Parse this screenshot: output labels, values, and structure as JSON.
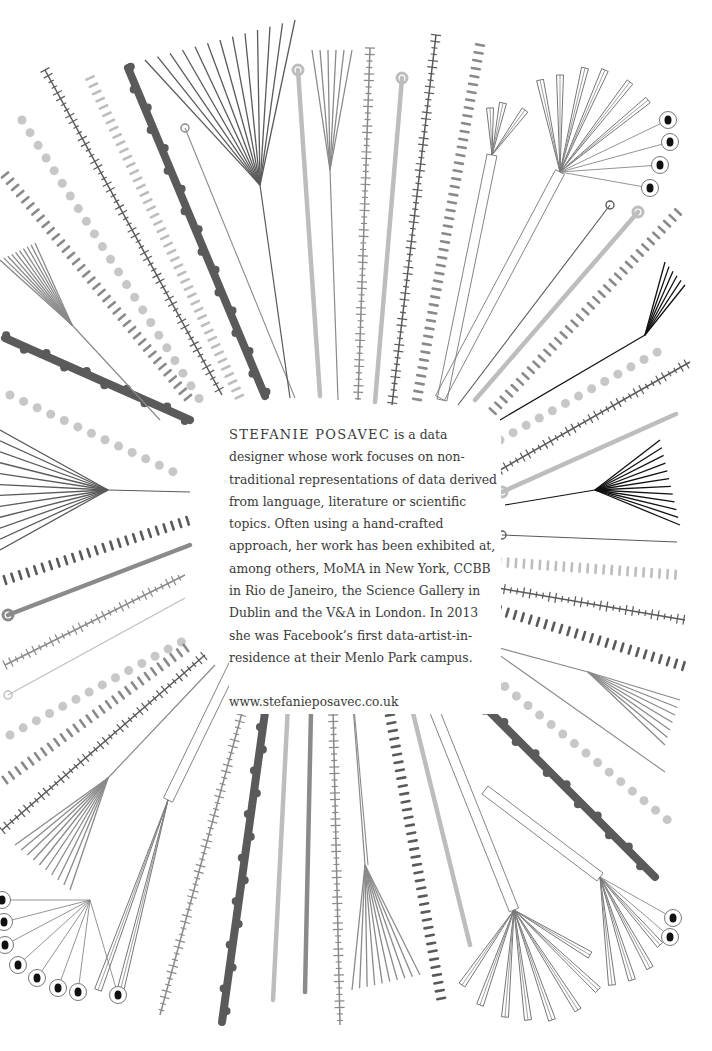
{
  "bio": {
    "name": "STEFANIE POSAVEC",
    "text": " is a data designer whose work focuses on non-traditional representations of data derived from language, literature or scientific topics. Often using a hand-crafted approach, her work has been exhibited at, among others, MoMA in New York, CCBB in Rio de Janeiro, the Science Gallery in Dublin and the V&A in London. In 2013 she was Facebook’s first data-artist-in-residence at their Menlo Park campus.",
    "url": "www.stefanieposavec.co.uk"
  },
  "artwork": {
    "description": "Hand-drawn radial illustration of lines, dotted strokes, hatched strokes, fans and looped stems surrounding the biography text",
    "colors": {
      "dark": "#5a5a5a",
      "mid": "#8a8a8a",
      "light": "#bdbdbd",
      "ink": "#111111"
    },
    "strokes": [
      {
        "x1": 45,
        "y1": 70,
        "x2": 222,
        "y2": 395,
        "style": "hatch",
        "c": "dark"
      },
      {
        "x1": 90,
        "y1": 78,
        "x2": 240,
        "y2": 398,
        "style": "dash",
        "c": "light"
      },
      {
        "x1": 128,
        "y1": 68,
        "x2": 265,
        "y2": 396,
        "style": "thick",
        "c": "dark"
      },
      {
        "x1": 185,
        "y1": 128,
        "x2": 295,
        "y2": 398,
        "style": "thin",
        "c": "mid"
      },
      {
        "x1": 298,
        "y1": 70,
        "x2": 320,
        "y2": 396,
        "style": "thickline",
        "c": "light"
      },
      {
        "x1": 370,
        "y1": 48,
        "x2": 358,
        "y2": 400,
        "style": "hatch",
        "c": "mid"
      },
      {
        "x1": 402,
        "y1": 78,
        "x2": 375,
        "y2": 402,
        "style": "thickline",
        "c": "light"
      },
      {
        "x1": 436,
        "y1": 35,
        "x2": 392,
        "y2": 405,
        "style": "hatch",
        "c": "dark"
      },
      {
        "x1": 480,
        "y1": 45,
        "x2": 416,
        "y2": 405,
        "style": "dash",
        "c": "mid"
      },
      {
        "x1": 610,
        "y1": 205,
        "x2": 458,
        "y2": 405,
        "style": "thin",
        "c": "dark"
      },
      {
        "x1": 638,
        "y1": 212,
        "x2": 475,
        "y2": 400,
        "style": "thickline",
        "c": "light"
      },
      {
        "x1": 678,
        "y1": 212,
        "x2": 492,
        "y2": 412,
        "style": "dash",
        "c": "mid"
      },
      {
        "x1": 22,
        "y1": 120,
        "x2": 200,
        "y2": 400,
        "style": "dots",
        "c": "light"
      },
      {
        "x1": 5,
        "y1": 175,
        "x2": 190,
        "y2": 400,
        "style": "dash",
        "c": "mid"
      },
      {
        "x1": 5,
        "y1": 338,
        "x2": 190,
        "y2": 420,
        "style": "thick",
        "c": "dark"
      },
      {
        "x1": 10,
        "y1": 395,
        "x2": 180,
        "y2": 475,
        "style": "dots",
        "c": "light"
      },
      {
        "x1": 5,
        "y1": 580,
        "x2": 190,
        "y2": 520,
        "style": "dash",
        "c": "dark"
      },
      {
        "x1": 8,
        "y1": 615,
        "x2": 190,
        "y2": 545,
        "style": "thickline",
        "c": "mid"
      },
      {
        "x1": 5,
        "y1": 665,
        "x2": 185,
        "y2": 575,
        "style": "hatch",
        "c": "mid"
      },
      {
        "x1": 8,
        "y1": 695,
        "x2": 185,
        "y2": 598,
        "style": "thin",
        "c": "light"
      },
      {
        "x1": 10,
        "y1": 735,
        "x2": 185,
        "y2": 640,
        "style": "dots",
        "c": "light"
      },
      {
        "x1": 5,
        "y1": 780,
        "x2": 190,
        "y2": 645,
        "style": "dash",
        "c": "mid"
      },
      {
        "x1": 2,
        "y1": 830,
        "x2": 205,
        "y2": 655,
        "style": "hatch",
        "c": "dark"
      },
      {
        "x1": 500,
        "y1": 440,
        "x2": 670,
        "y2": 345,
        "style": "dots",
        "c": "light"
      },
      {
        "x1": 500,
        "y1": 470,
        "x2": 690,
        "y2": 362,
        "style": "hatch",
        "c": "dark"
      },
      {
        "x1": 502,
        "y1": 492,
        "x2": 676,
        "y2": 414,
        "style": "thickline",
        "c": "light"
      },
      {
        "x1": 502,
        "y1": 535,
        "x2": 677,
        "y2": 542,
        "style": "thin",
        "c": "dark"
      },
      {
        "x1": 500,
        "y1": 562,
        "x2": 680,
        "y2": 575,
        "style": "dash",
        "c": "light"
      },
      {
        "x1": 498,
        "y1": 588,
        "x2": 685,
        "y2": 620,
        "style": "hatch",
        "c": "dark"
      },
      {
        "x1": 492,
        "y1": 608,
        "x2": 690,
        "y2": 668,
        "style": "dash",
        "c": "dark"
      },
      {
        "x1": 492,
        "y1": 650,
        "x2": 665,
        "y2": 772,
        "style": "thin",
        "c": "mid"
      },
      {
        "x1": 470,
        "y1": 658,
        "x2": 670,
        "y2": 822,
        "style": "dots",
        "c": "light"
      },
      {
        "x1": 440,
        "y1": 662,
        "x2": 655,
        "y2": 877,
        "style": "thick",
        "c": "dark"
      },
      {
        "x1": 255,
        "y1": 665,
        "x2": 160,
        "y2": 1015,
        "style": "hatch",
        "c": "mid"
      },
      {
        "x1": 272,
        "y1": 662,
        "x2": 222,
        "y2": 1022,
        "style": "thick",
        "c": "dark"
      },
      {
        "x1": 290,
        "y1": 665,
        "x2": 273,
        "y2": 1000,
        "style": "thickline",
        "c": "light"
      },
      {
        "x1": 312,
        "y1": 665,
        "x2": 305,
        "y2": 992,
        "style": "thickline",
        "c": "mid"
      },
      {
        "x1": 332,
        "y1": 663,
        "x2": 340,
        "y2": 1025,
        "style": "hatch",
        "c": "mid"
      },
      {
        "x1": 380,
        "y1": 660,
        "x2": 442,
        "y2": 1003,
        "style": "dash",
        "c": "dark"
      },
      {
        "x1": 400,
        "y1": 660,
        "x2": 470,
        "y2": 945,
        "style": "thickline",
        "c": "light"
      },
      {
        "x1": 350,
        "y1": 663,
        "x2": 368,
        "y2": 865,
        "style": "thin",
        "c": "mid"
      }
    ],
    "fans": [
      {
        "cx": 260,
        "cy": 185,
        "from": [
          145,
          60,
          295,
          20
        ],
        "n": 13,
        "stem": [
          260,
          185,
          290,
          398
        ],
        "c": "dark"
      },
      {
        "cx": 330,
        "cy": 170,
        "from": [
          312,
          50,
          352,
          50
        ],
        "n": 6,
        "stem": [
          330,
          170,
          338,
          400
        ],
        "c": "mid"
      },
      {
        "cx": 72,
        "cy": 325,
        "from": [
          0,
          260,
          35,
          243
        ],
        "n": 10,
        "stem": [
          72,
          325,
          160,
          420
        ],
        "c": "mid"
      },
      {
        "cx": 108,
        "cy": 490,
        "from": [
          0,
          430,
          0,
          550
        ],
        "n": 12,
        "stem": [
          108,
          490,
          190,
          492
        ],
        "c": "dark"
      },
      {
        "cx": 595,
        "cy": 490,
        "from": [
          660,
          440,
          680,
          525
        ],
        "n": 12,
        "stem": [
          595,
          490,
          505,
          505
        ],
        "c": "ink"
      },
      {
        "cx": 645,
        "cy": 335,
        "from": [
          665,
          262,
          685,
          285
        ],
        "n": 6,
        "stem": [
          645,
          335,
          500,
          420
        ],
        "c": "ink"
      },
      {
        "cx": 588,
        "cy": 672,
        "from": [
          680,
          700,
          665,
          745
        ],
        "n": 7,
        "stem": [
          588,
          672,
          470,
          640
        ],
        "c": "mid"
      },
      {
        "cx": 108,
        "cy": 778,
        "from": [
          15,
          845,
          70,
          890
        ],
        "n": 10,
        "stem": [
          108,
          778,
          215,
          665
        ],
        "c": "mid"
      },
      {
        "cx": 365,
        "cy": 865,
        "from": [
          352,
          990,
          420,
          975
        ],
        "n": 10,
        "stem": [
          365,
          865,
          350,
          665
        ],
        "c": "mid"
      }
    ],
    "eyeClusters": [
      {
        "cx": 560,
        "cy": 172,
        "eyes": [
          [
            668,
            120
          ],
          [
            670,
            142
          ],
          [
            660,
            165
          ],
          [
            650,
            188
          ]
        ]
      },
      {
        "cx": 90,
        "cy": 900,
        "eyes": [
          [
            2,
            900
          ],
          [
            4,
            922
          ],
          [
            5,
            945
          ],
          [
            18,
            965
          ],
          [
            37,
            978
          ],
          [
            58,
            988
          ],
          [
            78,
            992
          ],
          [
            118,
            995
          ]
        ]
      },
      {
        "cx": 600,
        "cy": 877,
        "eyes": [
          [
            673,
            918
          ],
          [
            670,
            937
          ]
        ]
      }
    ],
    "boxFans": [
      {
        "cx": 560,
        "cy": 172,
        "stem": [
          560,
          172,
          440,
          398
        ],
        "tips": [
          [
            540,
            80
          ],
          [
            560,
            75
          ],
          [
            585,
            68
          ],
          [
            605,
            70
          ],
          [
            630,
            82
          ],
          [
            648,
            100
          ]
        ]
      },
      {
        "cx": 492,
        "cy": 155,
        "stem": [
          492,
          155,
          442,
          400
        ],
        "tips": [
          [
            490,
            108
          ],
          [
            503,
            103
          ],
          [
            525,
            110
          ]
        ]
      },
      {
        "cx": 168,
        "cy": 800,
        "stem": [
          168,
          800,
          235,
          662
        ],
        "tips": [
          [
            98,
            990
          ],
          [
            118,
            1000
          ]
        ]
      },
      {
        "cx": 514,
        "cy": 910,
        "stem": [
          514,
          910,
          415,
          662
        ],
        "tips": [
          [
            462,
            985
          ],
          [
            480,
            1005
          ],
          [
            505,
            1017
          ],
          [
            528,
            1020
          ],
          [
            552,
            1020
          ],
          [
            578,
            1010
          ],
          [
            598,
            990
          ],
          [
            590,
            955
          ]
        ]
      },
      {
        "cx": 600,
        "cy": 877,
        "stem": [
          600,
          877,
          485,
          790
        ],
        "tips": [
          [
            612,
            985
          ],
          [
            632,
            980
          ],
          [
            650,
            968
          ],
          [
            660,
            945
          ]
        ]
      }
    ]
  }
}
